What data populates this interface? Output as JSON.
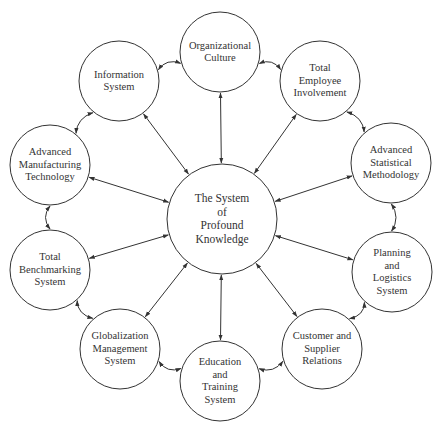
{
  "diagram": {
    "colors": {
      "stroke": "#333333",
      "text": "#333333",
      "background": "#ffffff"
    },
    "center": {
      "id": "center",
      "lines": [
        "The System",
        "of",
        "Profound",
        "Knowledge"
      ],
      "cx": 222,
      "cy": 219,
      "r": 55
    },
    "nodes": [
      {
        "id": "org-culture",
        "lines": [
          "Organizational",
          "Culture"
        ],
        "cx": 220,
        "cy": 52,
        "r": 40
      },
      {
        "id": "employee-involvement",
        "lines": [
          "Total",
          "Employee",
          "Involvement"
        ],
        "cx": 320,
        "cy": 81,
        "r": 40
      },
      {
        "id": "statistical-methodology",
        "lines": [
          "Advanced",
          "Statistical",
          "Methodology"
        ],
        "cx": 391,
        "cy": 163,
        "r": 40
      },
      {
        "id": "planning-logistics",
        "lines": [
          "Planning",
          "and",
          "Logistics",
          "System"
        ],
        "cx": 392,
        "cy": 272,
        "r": 40
      },
      {
        "id": "customer-supplier",
        "lines": [
          "Customer and",
          "Supplier",
          "Relations"
        ],
        "cx": 322,
        "cy": 349,
        "r": 40
      },
      {
        "id": "education-training",
        "lines": [
          "Education",
          "and",
          "Training",
          "System"
        ],
        "cx": 220,
        "cy": 381,
        "r": 40
      },
      {
        "id": "globalization-management",
        "lines": [
          "Globalization",
          "Management",
          "System"
        ],
        "cx": 120,
        "cy": 349,
        "r": 40
      },
      {
        "id": "benchmarking",
        "lines": [
          "Total",
          "Benchmarking",
          "System"
        ],
        "cx": 50,
        "cy": 270,
        "r": 40
      },
      {
        "id": "manufacturing-technology",
        "lines": [
          "Advanced",
          "Manufacturing",
          "Technology"
        ],
        "cx": 50,
        "cy": 165,
        "r": 40
      },
      {
        "id": "information-system",
        "lines": [
          "Information",
          "System"
        ],
        "cx": 119,
        "cy": 81,
        "r": 40
      }
    ],
    "edges": {
      "spokes": "bidirectional arrows from each outer node to center",
      "ring": "bidirectional curved arrows between adjacent outer nodes"
    }
  }
}
